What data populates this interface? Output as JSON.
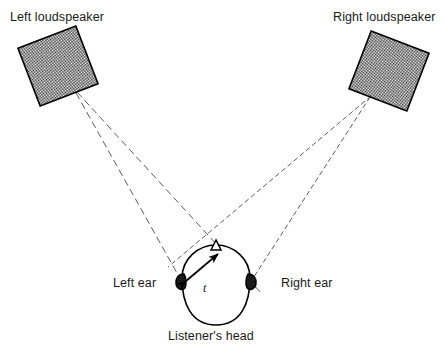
{
  "figure": {
    "title_text": "",
    "background_color": "#ffffff",
    "ink_color": "#000000",
    "speaker_fill_color": "#8f8f8f",
    "dashed_line_color": "#555555"
  },
  "labels": {
    "left_loudspeaker": "Left loudspeaker",
    "right_loudspeaker": "Right loudspeaker",
    "left_ear": "Left ear",
    "right_ear": "Right ear",
    "listeners_head": "Listener's head",
    "time_delay_symbol": "t"
  },
  "diagram_data": {
    "type": "diagram",
    "subject": "stereo loudspeaker crosstalk to listener's ears",
    "elements": [
      {
        "name": "left-loudspeaker",
        "shape": "rotated-square",
        "center": [
          58,
          66
        ],
        "size": 62,
        "rotation_deg": -21,
        "fill": "checkerboard-gray"
      },
      {
        "name": "right-loudspeaker",
        "shape": "rotated-square",
        "center": [
          389,
          71
        ],
        "size": 62,
        "rotation_deg": 21,
        "fill": "checkerboard-gray"
      },
      {
        "name": "listeners-head",
        "shape": "egg-oval",
        "center": [
          216,
          285
        ],
        "width": 68,
        "height": 80
      },
      {
        "name": "nose",
        "shape": "triangle",
        "position": [
          216,
          245
        ]
      },
      {
        "name": "left-ear",
        "shape": "ear",
        "position": [
          183,
          281
        ]
      },
      {
        "name": "right-ear",
        "shape": "ear",
        "position": [
          249,
          281
        ]
      }
    ],
    "sound_paths": [
      {
        "from": "left-loudspeaker",
        "to": "left-ear",
        "style": "dashed",
        "kind": "direct"
      },
      {
        "from": "left-loudspeaker",
        "to": "right-ear",
        "style": "dashed",
        "kind": "crosstalk"
      },
      {
        "from": "right-loudspeaker",
        "to": "right-ear",
        "style": "dashed",
        "kind": "direct"
      },
      {
        "from": "right-loudspeaker",
        "to": "left-ear",
        "style": "dashed",
        "kind": "crosstalk"
      }
    ],
    "annotations": [
      {
        "name": "time-delay-arrow",
        "symbol": "t",
        "style": "double-headed-arrow",
        "from": [
          184,
          282
        ],
        "to": [
          219,
          255
        ],
        "description": "interaural path-length/time difference"
      }
    ]
  }
}
